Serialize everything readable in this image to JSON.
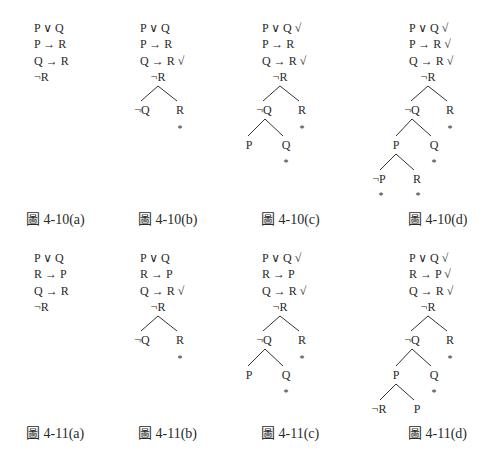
{
  "figures": [
    {
      "id": "4-10a",
      "caption": "圖 4-10(a)",
      "caption_x": 26,
      "caption_y": 224,
      "x": 34,
      "y0": 32,
      "formulas": [
        "P ∨ Q",
        "P → R",
        "Q → R",
        "¬R"
      ],
      "nodes": [],
      "edges": [],
      "stars": []
    },
    {
      "id": "4-10b",
      "caption": "圖 4-10(b)",
      "caption_x": 138,
      "caption_y": 224,
      "x": 140,
      "y0": 32,
      "formulas": [
        "P ∨ Q",
        "P → R",
        "Q → R √",
        ""
      ],
      "nodes": [
        {
          "label": "¬R",
          "x": 158,
          "y": 81
        },
        {
          "label": "¬Q",
          "x": 142,
          "y": 114
        },
        {
          "label": "R",
          "x": 180,
          "y": 114
        }
      ],
      "edges": [
        [
          158,
          86,
          141,
          101
        ],
        [
          158,
          86,
          177,
          101
        ]
      ],
      "stars": [
        {
          "x": 180,
          "y": 129
        }
      ]
    },
    {
      "id": "4-10c",
      "caption": "圖 4-10(c)",
      "caption_x": 261,
      "caption_y": 224,
      "x": 262,
      "y0": 32,
      "formulas": [
        "P ∨ Q √",
        "P → R",
        "Q → R √",
        ""
      ],
      "nodes": [
        {
          "label": "¬R",
          "x": 280,
          "y": 81
        },
        {
          "label": "¬Q",
          "x": 264,
          "y": 114
        },
        {
          "label": "R",
          "x": 302,
          "y": 114
        },
        {
          "label": "P",
          "x": 249,
          "y": 149
        },
        {
          "label": "Q",
          "x": 286,
          "y": 149
        }
      ],
      "edges": [
        [
          280,
          86,
          263,
          101
        ],
        [
          280,
          86,
          299,
          101
        ],
        [
          265,
          119,
          248,
          136
        ],
        [
          265,
          119,
          283,
          136
        ]
      ],
      "stars": [
        {
          "x": 302,
          "y": 129
        },
        {
          "x": 286,
          "y": 163
        }
      ]
    },
    {
      "id": "4-10d",
      "caption": "圖 4-10(d)",
      "caption_x": 408,
      "caption_y": 224,
      "x": 409,
      "y0": 32,
      "formulas": [
        "P ∨ Q √",
        "P → R √",
        "Q → R √",
        ""
      ],
      "nodes": [
        {
          "label": "¬R",
          "x": 428,
          "y": 81
        },
        {
          "label": "¬Q",
          "x": 412,
          "y": 114
        },
        {
          "label": "R",
          "x": 450,
          "y": 114
        },
        {
          "label": "P",
          "x": 396,
          "y": 149
        },
        {
          "label": "Q",
          "x": 434,
          "y": 149
        },
        {
          "label": "¬P",
          "x": 379,
          "y": 183
        },
        {
          "label": "R",
          "x": 417,
          "y": 183
        }
      ],
      "edges": [
        [
          428,
          86,
          411,
          101
        ],
        [
          428,
          86,
          447,
          101
        ],
        [
          412,
          119,
          396,
          136
        ],
        [
          412,
          119,
          431,
          136
        ],
        [
          396,
          154,
          380,
          170
        ],
        [
          396,
          154,
          414,
          170
        ]
      ],
      "stars": [
        {
          "x": 450,
          "y": 129
        },
        {
          "x": 434,
          "y": 163
        },
        {
          "x": 381,
          "y": 196
        },
        {
          "x": 418,
          "y": 196
        }
      ]
    },
    {
      "id": "4-11a",
      "caption": "圖 4-11(a)",
      "caption_x": 26,
      "caption_y": 438,
      "x": 34,
      "y0": 262,
      "formulas": [
        "P ∨ Q",
        "R → P",
        "Q → R",
        "¬R"
      ],
      "nodes": [],
      "edges": [],
      "stars": []
    },
    {
      "id": "4-11b",
      "caption": "圖 4-11(b)",
      "caption_x": 138,
      "caption_y": 438,
      "x": 140,
      "y0": 262,
      "formulas": [
        "P ∨ Q",
        "R → P",
        "Q → R √",
        ""
      ],
      "nodes": [
        {
          "label": "¬R",
          "x": 158,
          "y": 311
        },
        {
          "label": "¬Q",
          "x": 142,
          "y": 344
        },
        {
          "label": "R",
          "x": 180,
          "y": 344
        }
      ],
      "edges": [
        [
          158,
          316,
          141,
          331
        ],
        [
          158,
          316,
          177,
          331
        ]
      ],
      "stars": [
        {
          "x": 180,
          "y": 359
        }
      ]
    },
    {
      "id": "4-11c",
      "caption": "圖 4-11(c)",
      "caption_x": 261,
      "caption_y": 438,
      "x": 262,
      "y0": 262,
      "formulas": [
        "P ∨ Q √",
        "R → P",
        "Q → R √",
        ""
      ],
      "nodes": [
        {
          "label": "¬R",
          "x": 280,
          "y": 311
        },
        {
          "label": "¬Q",
          "x": 264,
          "y": 344
        },
        {
          "label": "R",
          "x": 302,
          "y": 344
        },
        {
          "label": "P",
          "x": 249,
          "y": 379
        },
        {
          "label": "Q",
          "x": 286,
          "y": 379
        }
      ],
      "edges": [
        [
          280,
          316,
          263,
          331
        ],
        [
          280,
          316,
          299,
          331
        ],
        [
          265,
          349,
          248,
          366
        ],
        [
          265,
          349,
          283,
          366
        ]
      ],
      "stars": [
        {
          "x": 302,
          "y": 359
        },
        {
          "x": 286,
          "y": 393
        }
      ]
    },
    {
      "id": "4-11d",
      "caption": "圖 4-11(d)",
      "caption_x": 408,
      "caption_y": 438,
      "x": 409,
      "y0": 262,
      "formulas": [
        "P ∨ Q √",
        "R → P √",
        "Q → R √",
        ""
      ],
      "nodes": [
        {
          "label": "¬R",
          "x": 428,
          "y": 311
        },
        {
          "label": "¬Q",
          "x": 412,
          "y": 344
        },
        {
          "label": "R",
          "x": 450,
          "y": 344
        },
        {
          "label": "P",
          "x": 396,
          "y": 379
        },
        {
          "label": "Q",
          "x": 434,
          "y": 379
        },
        {
          "label": "¬R",
          "x": 379,
          "y": 413
        },
        {
          "label": "P",
          "x": 417,
          "y": 413
        }
      ],
      "edges": [
        [
          428,
          316,
          411,
          331
        ],
        [
          428,
          316,
          447,
          331
        ],
        [
          412,
          349,
          396,
          366
        ],
        [
          412,
          349,
          431,
          366
        ],
        [
          396,
          384,
          380,
          400
        ],
        [
          396,
          384,
          414,
          400
        ]
      ],
      "stars": [
        {
          "x": 450,
          "y": 359
        },
        {
          "x": 434,
          "y": 393
        }
      ]
    }
  ],
  "layout": {
    "line_spacing": 16.3,
    "star_glyph": "*",
    "text_color": "#2a2a2a",
    "edge_color": "#333333"
  }
}
